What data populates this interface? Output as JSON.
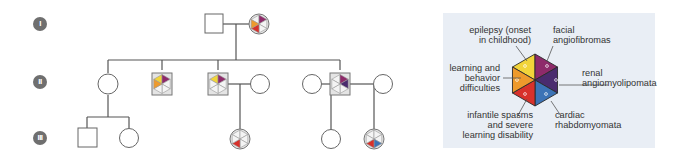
{
  "generations": [
    {
      "label": "I"
    },
    {
      "label": "II"
    },
    {
      "label": "III"
    }
  ],
  "legend": {
    "segments": [
      {
        "key": "epilepsy",
        "label_lines": [
          "epilepsy (onset",
          "in childhood)"
        ],
        "color": "#f2d43a",
        "position": "top-left"
      },
      {
        "key": "facial",
        "label_lines": [
          "facial",
          "angiofibromas"
        ],
        "color": "#8e2a6a",
        "position": "top-right"
      },
      {
        "key": "renal",
        "label_lines": [
          "renal",
          "angiomyolipomata"
        ],
        "color": "#4a2b6e",
        "position": "right"
      },
      {
        "key": "cardiac",
        "label_lines": [
          "cardiac",
          "rhabdomyomata"
        ],
        "color": "#3c73b6",
        "position": "bottom-right"
      },
      {
        "key": "spasms",
        "label_lines": [
          "infantile spasms",
          "and severe",
          "learning  disability"
        ],
        "color": "#d8312b",
        "position": "bottom-left"
      },
      {
        "key": "learning",
        "label_lines": [
          "learning and",
          "behavior",
          "difficulties"
        ],
        "color": "#ee9a2c",
        "position": "left"
      }
    ]
  },
  "individuals": [
    {
      "id": "I-1",
      "sex": "male",
      "affected": []
    },
    {
      "id": "I-2",
      "sex": "female",
      "affected": [
        "facial",
        "learning",
        "spasms"
      ]
    },
    {
      "id": "II-1",
      "sex": "female",
      "affected": []
    },
    {
      "id": "II-2",
      "sex": "male",
      "affected": [
        "epilepsy",
        "facial",
        "learning"
      ]
    },
    {
      "id": "II-3",
      "sex": "male",
      "affected": [
        "epilepsy",
        "facial"
      ]
    },
    {
      "id": "II-4",
      "sex": "female",
      "affected": []
    },
    {
      "id": "II-5",
      "sex": "female",
      "affected": []
    },
    {
      "id": "II-6",
      "sex": "male",
      "affected": [
        "facial",
        "renal"
      ]
    },
    {
      "id": "II-7",
      "sex": "female",
      "affected": []
    },
    {
      "id": "III-1",
      "sex": "male",
      "affected": []
    },
    {
      "id": "III-2",
      "sex": "female",
      "affected": []
    },
    {
      "id": "III-3",
      "sex": "female",
      "affected": [
        "spasms"
      ]
    },
    {
      "id": "III-4",
      "sex": "female",
      "affected": []
    },
    {
      "id": "III-5",
      "sex": "female",
      "affected": [
        "spasms",
        "cardiac"
      ]
    }
  ]
}
